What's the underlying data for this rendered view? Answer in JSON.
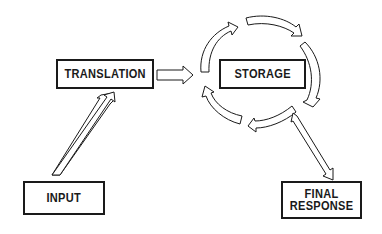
{
  "diagram": {
    "nodes": {
      "translation": {
        "label": "TRANSLATION"
      },
      "storage": {
        "label": "STORAGE"
      },
      "input": {
        "label": "INPUT"
      },
      "final_response": {
        "label": "FINAL\nRESPONSE"
      }
    },
    "edges": [
      {
        "from": "input",
        "to": "translation"
      },
      {
        "from": "translation",
        "to": "storage"
      },
      {
        "from": "storage",
        "to": "storage",
        "type": "cycle"
      },
      {
        "from": "storage",
        "to": "final_response"
      }
    ],
    "colors": {
      "stroke": "#1a1a1a",
      "background": "#ffffff"
    }
  }
}
